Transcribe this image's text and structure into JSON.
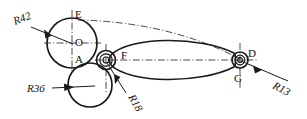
{
  "drawing": {
    "title": "Geometric construction with tangent circles and radii",
    "background_color": "#ffffff",
    "line_color": "#1a1a1a",
    "centerline_color": "#2b2b2b",
    "width": 307,
    "height": 119,
    "point_labels": [
      {
        "id": "E",
        "text": "E",
        "x": 75,
        "y": 18
      },
      {
        "id": "O",
        "text": "O",
        "x": 75,
        "y": 46
      },
      {
        "id": "A",
        "text": "A",
        "x": 75,
        "y": 62
      },
      {
        "id": "F",
        "text": "F",
        "x": 121,
        "y": 60
      },
      {
        "id": "D",
        "text": "D",
        "x": 249,
        "y": 57
      },
      {
        "id": "G",
        "text": "G",
        "x": 236,
        "y": 82
      }
    ],
    "radius_labels": [
      {
        "id": "R42",
        "text": "R42",
        "x": 16,
        "y": 24,
        "rotation": -22
      },
      {
        "id": "R36",
        "text": "R36",
        "x": 28,
        "y": 92,
        "rotation": 0
      },
      {
        "id": "R18",
        "text": "R18",
        "x": 128,
        "y": 96,
        "rotation": 62
      },
      {
        "id": "R13",
        "text": "R13",
        "x": 272,
        "y": 86,
        "rotation": 28
      }
    ],
    "circles": [
      {
        "id": "circle-O-R42",
        "cx": 72,
        "cy": 43,
        "r": 25
      },
      {
        "id": "circle-A-R36",
        "cx": 90,
        "cy": 85,
        "r": 22
      },
      {
        "id": "circle-F-outer-R18",
        "cx": 106,
        "cy": 60,
        "r": 10
      },
      {
        "id": "circle-F-mid",
        "cx": 106,
        "cy": 60,
        "r": 6.5
      },
      {
        "id": "circle-F-inner",
        "cx": 106,
        "cy": 60,
        "r": 3.2
      },
      {
        "id": "circle-D-outer-R13",
        "cx": 240,
        "cy": 60,
        "r": 8.5
      },
      {
        "id": "circle-D-mid",
        "cx": 240,
        "cy": 60,
        "r": 5
      },
      {
        "id": "circle-D-inner",
        "cx": 240,
        "cy": 60,
        "r": 2.4
      }
    ],
    "lens_body": {
      "id": "lens-between-F-and-D",
      "left_x": 112,
      "right_x": 236,
      "center_y": 60,
      "half_height": 20
    },
    "center_lines": [
      {
        "id": "centerline-vertical-O",
        "x1": 72,
        "y1": 10,
        "x2": 72,
        "y2": 72
      },
      {
        "id": "centerline-horizontal-O",
        "x1": 44,
        "y1": 43,
        "x2": 101,
        "y2": 43
      },
      {
        "id": "centerline-vertical-F",
        "x1": 106,
        "y1": 44,
        "x2": 106,
        "y2": 92
      },
      {
        "id": "centerline-horizontal-FD",
        "x1": 96,
        "y1": 60,
        "x2": 256,
        "y2": 60
      },
      {
        "id": "centerline-vertical-D",
        "x1": 240,
        "y1": 44,
        "x2": 240,
        "y2": 90
      },
      {
        "id": "centerline-arc-E-to-D",
        "from": "E",
        "to": "D"
      }
    ],
    "leaders": [
      {
        "id": "leader-R42",
        "x1": 30,
        "y1": 28,
        "x2": 73,
        "y2": 44,
        "arrow_at": "mid"
      },
      {
        "id": "leader-R36",
        "x1": 53,
        "y1": 88,
        "x2": 93,
        "y2": 86,
        "arrow_at": "mid"
      },
      {
        "id": "leader-R18",
        "x1": 125,
        "y1": 92,
        "x2": 106,
        "y2": 62,
        "arrow_at": "mid"
      },
      {
        "id": "leader-R13",
        "x1": 286,
        "y1": 80,
        "x2": 241,
        "y2": 61,
        "arrow_at": "mid"
      }
    ]
  }
}
